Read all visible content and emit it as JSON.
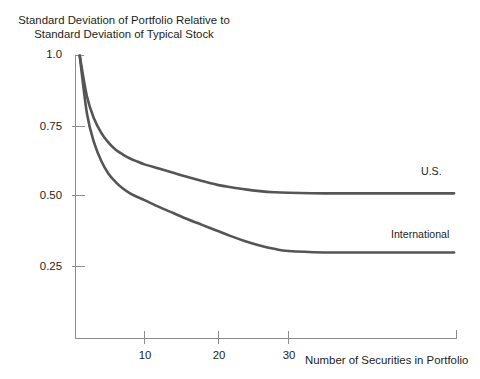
{
  "chart_data": {
    "type": "line",
    "xlabel": "Number of Securities in Portfolio",
    "ylabel": "",
    "xlim": [
      1,
      53
    ],
    "ylim": [
      0,
      1.05
    ],
    "grid": false,
    "legend_position": "inline-right-of-curve",
    "xticks": [
      10,
      20,
      30
    ],
    "xtick_labels": [
      "10",
      "20",
      "30"
    ],
    "yticks": [
      0.25,
      0.5,
      0.75,
      1.0
    ],
    "ytick_labels": [
      "0.25",
      "0.50",
      "0.75",
      "1.0"
    ],
    "x": [
      1,
      2,
      3,
      4,
      5,
      6,
      7,
      8,
      9,
      10,
      12,
      14,
      16,
      18,
      20,
      22,
      24,
      26,
      28,
      30,
      35,
      40,
      45,
      50,
      53
    ],
    "series": [
      {
        "name": "U.S.",
        "label": "U.S.",
        "color": "#555555",
        "values": [
          1.0,
          0.855,
          0.775,
          0.725,
          0.69,
          0.665,
          0.648,
          0.634,
          0.623,
          0.613,
          0.598,
          0.583,
          0.568,
          0.554,
          0.541,
          0.532,
          0.524,
          0.518,
          0.514,
          0.512,
          0.51,
          0.51,
          0.51,
          0.51,
          0.51
        ]
      },
      {
        "name": "International",
        "label": "International",
        "color": "#555555",
        "values": [
          1.0,
          0.795,
          0.69,
          0.625,
          0.58,
          0.55,
          0.527,
          0.51,
          0.497,
          0.486,
          0.462,
          0.44,
          0.418,
          0.398,
          0.378,
          0.358,
          0.34,
          0.325,
          0.313,
          0.305,
          0.3,
          0.3,
          0.3,
          0.3,
          0.3
        ]
      }
    ],
    "annotations": [
      {
        "text": "U.S.",
        "x": 48,
        "y": 0.565
      },
      {
        "text": "International",
        "x": 42,
        "y": 0.345
      }
    ],
    "colors": {
      "curve": "#555555",
      "axis": "#8d8d8d",
      "text": "#1d1d1d",
      "background": "#ffffff"
    }
  },
  "axis": {
    "y_labels": [
      "1.0",
      "0.75",
      "0.50",
      "0.25"
    ],
    "x_labels": [
      "10",
      "20",
      "30"
    ],
    "x_title": "Number of Securities in Portfolio"
  },
  "title": {
    "line1": "Standard Deviation of Portfolio Relative to",
    "line2": "Standard Deviation of Typical Stock"
  }
}
